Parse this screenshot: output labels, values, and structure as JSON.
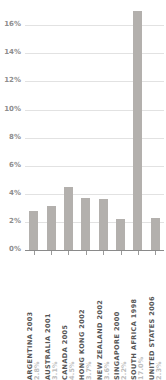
{
  "chart_data": {
    "type": "bar",
    "title": "",
    "subtitle": "",
    "xlabel": "",
    "ylabel": "",
    "ylim": [
      0,
      17.8
    ],
    "grid": true,
    "legend": "none",
    "orientation": "vertical",
    "bar_color": "#b3b0ad",
    "gridline_color": "#e2e2e2",
    "axis_color": "#8a8a8a",
    "value_label_color": "#bdbdbd",
    "category_label_color": "#555555",
    "ytick_label_color": "#8d8d8d",
    "label_rotation_degrees": 90,
    "note": "South Africa bar is clipped by the top of the plot frame",
    "categories": [
      "ARGENTINA 2003",
      "AUSTRALIA 2001",
      "CANADA 2005",
      "HONG KONG 2002",
      "NEW ZEALAND 2002",
      "SINGAPORE 2000",
      "SOUTH AFRICA 1998",
      "UNITED STATES 2006"
    ],
    "values": [
      2.8,
      3.1,
      4.5,
      3.7,
      3.6,
      2.2,
      17.0,
      2.3
    ],
    "value_labels": [
      "2.8%",
      "3.1%",
      "4.5%",
      "3.7%",
      "3.6%",
      "2.2%",
      "17.0%",
      "2.3%"
    ],
    "yticks": [
      0,
      2,
      4,
      6,
      8,
      10,
      12,
      14,
      16
    ],
    "ytick_labels": [
      "0%",
      "2%",
      "4%",
      "6%",
      "8%",
      "10%",
      "12%",
      "14%",
      "16%"
    ],
    "bars": [
      {
        "category": "ARGENTINA 2003",
        "country": "ARGENTINA",
        "year": "2003",
        "value": 2.8,
        "label": "2.8%"
      },
      {
        "category": "AUSTRALIA 2001",
        "country": "AUSTRALIA",
        "year": "2001",
        "value": 3.1,
        "label": "3.1%"
      },
      {
        "category": "CANADA 2005",
        "country": "CANADA",
        "year": "2005",
        "value": 4.5,
        "label": "4.5%"
      },
      {
        "category": "HONG KONG 2002",
        "country": "HONG KONG",
        "year": "2002",
        "value": 3.7,
        "label": "3.7%"
      },
      {
        "category": "NEW ZEALAND 2002",
        "country": "NEW ZEALAND",
        "year": "2002",
        "value": 3.6,
        "label": "3.6%"
      },
      {
        "category": "SINGAPORE 2000",
        "country": "SINGAPORE",
        "year": "2000",
        "value": 2.2,
        "label": "2.2%"
      },
      {
        "category": "SOUTH AFRICA 1998",
        "country": "SOUTH AFRICA",
        "year": "1998",
        "value": 17.0,
        "label": "17.0%"
      },
      {
        "category": "UNITED STATES 2006",
        "country": "UNITED STATES",
        "year": "2006",
        "value": 2.3,
        "label": "2.3%"
      }
    ]
  }
}
